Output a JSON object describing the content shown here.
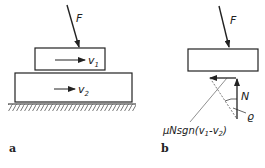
{
  "panels": [
    {
      "caption": "a",
      "force_label": "F",
      "blocks": [
        {
          "velocity_label": "v",
          "velocity_sub": "1"
        },
        {
          "velocity_label": "v",
          "velocity_sub": "2"
        }
      ]
    },
    {
      "caption": "b",
      "force_label": "F",
      "normal_label": "N",
      "angle_label": "ϱ",
      "friction_label": "μNsgn(v",
      "friction_label_sub1": "1",
      "friction_label_mid": "-v",
      "friction_label_sub2": "2",
      "friction_label_end": ")"
    }
  ]
}
